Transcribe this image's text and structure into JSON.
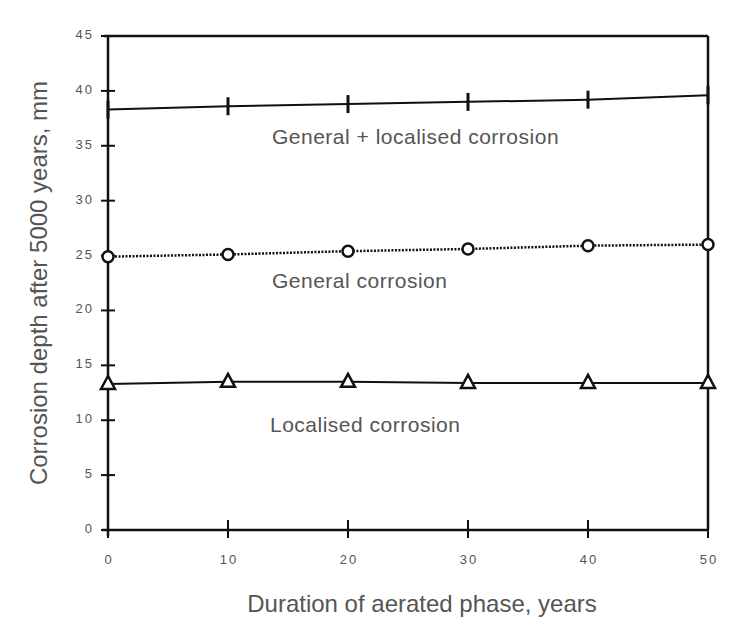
{
  "chart_data": {
    "type": "line",
    "title": "",
    "xlabel": "Duration of aerated phase, years",
    "ylabel": "Corrosion depth after 5000 years, mm",
    "xlim": [
      0,
      50
    ],
    "ylim": [
      0,
      45
    ],
    "x": [
      0,
      10,
      20,
      30,
      40,
      50
    ],
    "x_ticks": [
      "0",
      "10",
      "20",
      "30",
      "40",
      "50"
    ],
    "y_ticks": [
      "0",
      "5",
      "10",
      "15",
      "20",
      "25",
      "30",
      "35",
      "40",
      "45"
    ],
    "grid": false,
    "legend": "inline labels",
    "series": [
      {
        "name": "General + localised corrosion",
        "marker": "plus",
        "line": "solid",
        "values": [
          38.3,
          38.6,
          38.8,
          39.0,
          39.2,
          39.6
        ],
        "label_pos": [
          272,
          144
        ]
      },
      {
        "name": "General corrosion",
        "marker": "circle",
        "line": "dotted",
        "values": [
          24.9,
          25.1,
          25.4,
          25.6,
          25.9,
          26.0
        ],
        "label_pos": [
          272,
          288
        ]
      },
      {
        "name": "Localised corrosion",
        "marker": "triangle",
        "line": "solid",
        "values": [
          13.3,
          13.5,
          13.5,
          13.4,
          13.4,
          13.4
        ],
        "label_pos": [
          270,
          432
        ]
      }
    ]
  },
  "colors": {
    "axis": "#111111",
    "text": "#555555",
    "series": "#111111"
  }
}
